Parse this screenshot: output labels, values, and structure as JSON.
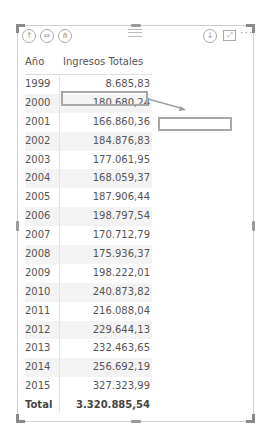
{
  "visual": {
    "toolbar": {
      "icons": [
        {
          "name": "drill-up-icon",
          "glyph": "↑"
        },
        {
          "name": "expand-all-icon",
          "glyph": "⇔"
        },
        {
          "name": "drill-down-hierarchy-icon",
          "glyph": "⋔"
        },
        {
          "name": "drill-mode-icon",
          "glyph": "↓"
        },
        {
          "name": "focus-mode-icon",
          "glyph": "⤢"
        },
        {
          "name": "more-options-icon",
          "glyph": "···"
        }
      ]
    },
    "table": {
      "columns": [
        "Año",
        "Ingresos Totales"
      ],
      "rows": [
        {
          "year": "1999",
          "value": "8.685,83"
        },
        {
          "year": "2000",
          "value": "180.680,24"
        },
        {
          "year": "2001",
          "value": "166.860,36"
        },
        {
          "year": "2002",
          "value": "184.876,83"
        },
        {
          "year": "2003",
          "value": "177.061,95"
        },
        {
          "year": "2004",
          "value": "168.059,37"
        },
        {
          "year": "2005",
          "value": "187.906,44"
        },
        {
          "year": "2006",
          "value": "198.797,54"
        },
        {
          "year": "2007",
          "value": "170.712,79"
        },
        {
          "year": "2008",
          "value": "175.936,37"
        },
        {
          "year": "2009",
          "value": "198.222,01"
        },
        {
          "year": "2010",
          "value": "240.873,82"
        },
        {
          "year": "2011",
          "value": "216.088,04"
        },
        {
          "year": "2012",
          "value": "229.644,13"
        },
        {
          "year": "2013",
          "value": "232.463,65"
        },
        {
          "year": "2014",
          "value": "256.692,19"
        },
        {
          "year": "2015",
          "value": "327.323,99"
        }
      ],
      "total": {
        "label": "Total",
        "value": "3.320.885,54"
      }
    },
    "annotation": {
      "highlighted_row": "2000",
      "border_color": "#a8a8a8"
    }
  }
}
